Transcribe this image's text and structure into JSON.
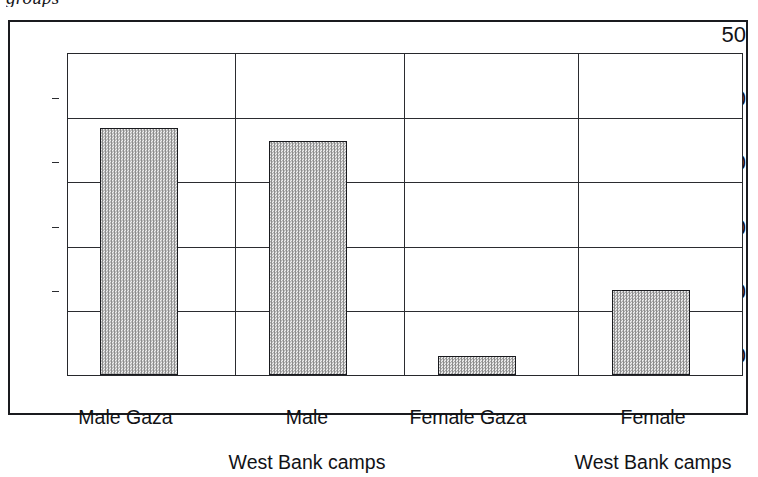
{
  "caption_fragment": "groups",
  "chart_data": {
    "type": "bar",
    "title": "",
    "subtitle": "",
    "xlabel": "",
    "ylabel": "",
    "categories": [
      "Male Gaza",
      "Male\nWest Bank camps",
      "Female Gaza",
      "Female\nWest Bank camps"
    ],
    "category_lines": [
      [
        "Male Gaza"
      ],
      [
        "Male",
        "West Bank camps"
      ],
      [
        "Female Gaza"
      ],
      [
        "Female",
        "West Bank camps"
      ]
    ],
    "values": [
      38.4,
      36.5,
      3.0,
      13.2
    ],
    "ylim": [
      0,
      50
    ],
    "ytick_labels": [
      "0",
      "10",
      "20",
      "30",
      "40",
      "50"
    ],
    "ytick_values": [
      0,
      10,
      20,
      30,
      40,
      50
    ],
    "grid": "horizontal",
    "legend": "none",
    "bar_fill_color": "#c9c9c9",
    "bar_edge_color": "#191a1e",
    "axis_color": "#2b2c30",
    "frame_color": "#1a1b1f"
  }
}
